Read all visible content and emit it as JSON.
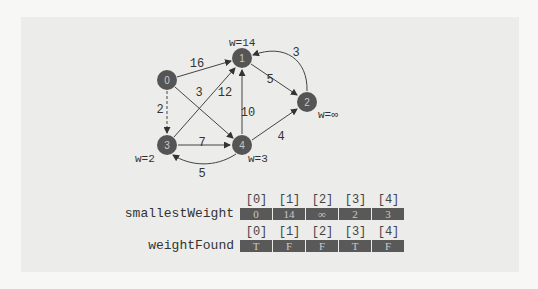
{
  "graph": {
    "nodes": [
      {
        "id": "0",
        "x": 167,
        "y": 80
      },
      {
        "id": "1",
        "x": 242,
        "y": 58
      },
      {
        "id": "2",
        "x": 307,
        "y": 102
      },
      {
        "id": "3",
        "x": 167,
        "y": 145
      },
      {
        "id": "4",
        "x": 242,
        "y": 145
      }
    ],
    "edges": [
      {
        "from": "0",
        "to": "1",
        "weight": "16",
        "style": "solid"
      },
      {
        "from": "0",
        "to": "4",
        "weight": "3",
        "style": "solid"
      },
      {
        "from": "0",
        "to": "3",
        "weight": "2",
        "style": "dashed"
      },
      {
        "from": "1",
        "to": "2",
        "weight": "5",
        "style": "solid"
      },
      {
        "from": "2",
        "to": "1",
        "weight": "3",
        "style": "curved"
      },
      {
        "from": "3",
        "to": "1",
        "weight": "12",
        "style": "solid"
      },
      {
        "from": "3",
        "to": "4",
        "weight": "7",
        "style": "solid"
      },
      {
        "from": "4",
        "to": "1",
        "weight": "10",
        "style": "solid"
      },
      {
        "from": "4",
        "to": "2",
        "weight": "4",
        "style": "solid"
      },
      {
        "from": "4",
        "to": "3",
        "weight": "5",
        "style": "curved"
      }
    ],
    "node_weights": {
      "w1": "w=14",
      "w2": "w=∞",
      "w3": "w=2",
      "w4": "w=3"
    }
  },
  "arrays": {
    "smallestWeight": {
      "label": "smallestWeight",
      "indices": [
        "[0]",
        "[1]",
        "[2]",
        "[3]",
        "[4]"
      ],
      "values": [
        "0",
        "14",
        "∞",
        "2",
        "3"
      ]
    },
    "weightFound": {
      "label": "weightFound",
      "indices": [
        "[0]",
        "[1]",
        "[2]",
        "[3]",
        "[4]"
      ],
      "values": [
        "T",
        "F",
        "F",
        "T",
        "F"
      ]
    }
  },
  "colors": {
    "node_fill": "#555555",
    "node_text": "#c8c8c8",
    "edge": "#333333",
    "cell_fill": "#595959"
  }
}
